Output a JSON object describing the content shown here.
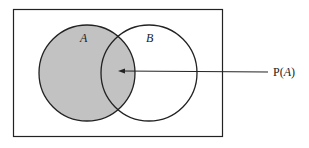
{
  "diagram": {
    "type": "venn",
    "sets": [
      {
        "label": "A",
        "shaded": true
      },
      {
        "label": "B",
        "shaded": false
      }
    ],
    "annotation": {
      "label_prefix": "P(",
      "label_var": "A",
      "label_suffix": ")",
      "target": "set A"
    },
    "colors": {
      "shade": "#c2c2c2",
      "stroke": "#222222"
    }
  }
}
